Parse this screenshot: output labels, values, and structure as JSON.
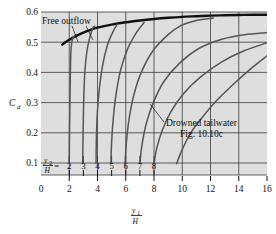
{
  "chart_data": {
    "type": "line",
    "title": "",
    "xlabel": "y1/H",
    "ylabel": "Cd",
    "xlim": [
      0,
      16
    ],
    "ylim": [
      0,
      0.6
    ],
    "grid": true,
    "legend_position": "inline-annotations",
    "x_ticks": [
      0,
      2,
      4,
      6,
      8,
      10,
      12,
      14,
      16
    ],
    "x_tick_labels": [
      "0",
      "2",
      "4",
      "6",
      "8",
      "10",
      "12",
      "14",
      "16"
    ],
    "y_ticks": [
      0.1,
      0.2,
      0.3,
      0.4,
      0.5,
      0.6
    ],
    "y_tick_labels": [
      "0.1",
      "0.2",
      "0.3",
      "0.4",
      "0.5",
      "0.6"
    ],
    "x_axis_symbol_numerator": "y",
    "x_axis_symbol_numerator_sub": "1",
    "x_axis_symbol_denominator": "H",
    "y_axis_symbol": "C",
    "y_axis_symbol_sub": "d",
    "family_label_numerator": "y",
    "family_label_numerator_sub": "2",
    "family_label_denominator": "H",
    "family_label_equals": "=",
    "annotations": [
      {
        "name": "free-outflow",
        "text": "Free outflow",
        "x": 1.5,
        "y": 0.585
      },
      {
        "name": "drowned-tailwater",
        "text": "Drowned tailwater",
        "x": 9.2,
        "y": 0.225
      },
      {
        "name": "figure-reference",
        "text": "Fig. 10.10c",
        "x": 10.2,
        "y": 0.18
      }
    ],
    "series": [
      {
        "name": "free-outflow-curve",
        "label": "Free outflow",
        "style": "thick",
        "points": [
          [
            1.5,
            0.492
          ],
          [
            2.0,
            0.508
          ],
          [
            2.5,
            0.521
          ],
          [
            3.0,
            0.532
          ],
          [
            3.5,
            0.541
          ],
          [
            4.0,
            0.548
          ],
          [
            5.0,
            0.558
          ],
          [
            6.0,
            0.566
          ],
          [
            7.0,
            0.572
          ],
          [
            8.0,
            0.577
          ],
          [
            9.0,
            0.581
          ],
          [
            10.0,
            0.584
          ],
          [
            11.0,
            0.586
          ],
          [
            12.0,
            0.588
          ],
          [
            13.0,
            0.589
          ],
          [
            14.0,
            0.59
          ],
          [
            15.0,
            0.591
          ],
          [
            16.0,
            0.591
          ]
        ]
      },
      {
        "name": "tailwater-curve-2",
        "label": "2",
        "style": "thin",
        "points": [
          [
            2.0,
            0.098
          ],
          [
            2.02,
            0.2
          ],
          [
            2.05,
            0.3
          ],
          [
            2.08,
            0.4
          ],
          [
            2.12,
            0.47
          ],
          [
            2.2,
            0.505
          ],
          [
            2.35,
            0.52
          ],
          [
            2.5,
            0.525
          ]
        ]
      },
      {
        "name": "tailwater-curve-3",
        "label": "3",
        "style": "thin",
        "points": [
          [
            2.95,
            0.098
          ],
          [
            2.98,
            0.2
          ],
          [
            3.02,
            0.3
          ],
          [
            3.1,
            0.4
          ],
          [
            3.25,
            0.47
          ],
          [
            3.45,
            0.515
          ],
          [
            3.65,
            0.545
          ],
          [
            3.8,
            0.553
          ]
        ]
      },
      {
        "name": "tailwater-curve-4",
        "label": "4",
        "style": "thin",
        "points": [
          [
            3.9,
            0.098
          ],
          [
            3.92,
            0.18
          ],
          [
            3.98,
            0.26
          ],
          [
            4.12,
            0.34
          ],
          [
            4.35,
            0.42
          ],
          [
            4.7,
            0.49
          ],
          [
            5.1,
            0.535
          ],
          [
            5.4,
            0.56
          ]
        ]
      },
      {
        "name": "tailwater-curve-5",
        "label": "5",
        "style": "thin",
        "points": [
          [
            4.95,
            0.098
          ],
          [
            5.0,
            0.17
          ],
          [
            5.12,
            0.25
          ],
          [
            5.32,
            0.33
          ],
          [
            5.65,
            0.41
          ],
          [
            6.15,
            0.48
          ],
          [
            6.8,
            0.535
          ],
          [
            7.3,
            0.565
          ]
        ]
      },
      {
        "name": "tailwater-curve-6",
        "label": "6",
        "style": "thin",
        "points": [
          [
            5.95,
            0.098
          ],
          [
            6.05,
            0.17
          ],
          [
            6.25,
            0.25
          ],
          [
            6.6,
            0.33
          ],
          [
            7.1,
            0.4
          ],
          [
            7.9,
            0.47
          ],
          [
            9.0,
            0.525
          ],
          [
            9.9,
            0.555
          ],
          [
            11.0,
            0.572
          ],
          [
            12.2,
            0.58
          ]
        ]
      },
      {
        "name": "tailwater-curve-7",
        "label": "7",
        "style": "thin",
        "points": [
          [
            7.0,
            0.098
          ],
          [
            7.15,
            0.16
          ],
          [
            7.45,
            0.23
          ],
          [
            7.95,
            0.3
          ],
          [
            8.7,
            0.37
          ],
          [
            9.8,
            0.43
          ],
          [
            11.2,
            0.48
          ],
          [
            12.8,
            0.51
          ],
          [
            14.4,
            0.525
          ],
          [
            16.0,
            0.532
          ]
        ]
      },
      {
        "name": "tailwater-curve-8",
        "label": "8",
        "style": "thin",
        "points": [
          [
            8.0,
            0.098
          ],
          [
            8.2,
            0.15
          ],
          [
            8.6,
            0.21
          ],
          [
            9.2,
            0.27
          ],
          [
            10.1,
            0.33
          ],
          [
            11.3,
            0.385
          ],
          [
            12.8,
            0.435
          ],
          [
            14.3,
            0.47
          ],
          [
            16.0,
            0.498
          ]
        ]
      },
      {
        "name": "tailwater-curve-9",
        "label": "",
        "style": "thin",
        "points": [
          [
            9.6,
            0.098
          ],
          [
            10.0,
            0.145
          ],
          [
            10.6,
            0.2
          ],
          [
            11.4,
            0.25
          ],
          [
            12.4,
            0.305
          ],
          [
            13.6,
            0.36
          ],
          [
            14.8,
            0.41
          ],
          [
            16.0,
            0.455
          ]
        ]
      }
    ],
    "family_tick_labels": [
      "2",
      "3",
      "4",
      "5",
      "6",
      "7",
      "8"
    ],
    "family_tick_positions": [
      2,
      3,
      4,
      5,
      6,
      7,
      8
    ]
  }
}
